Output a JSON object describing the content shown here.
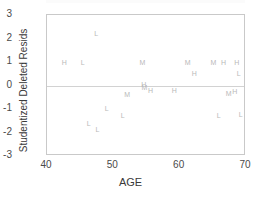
{
  "chart_data": {
    "type": "scatter",
    "title": "",
    "xlabel": "AGE",
    "ylabel": "Studentized Deleted Resids",
    "xlim": [
      40,
      70
    ],
    "ylim": [
      -3,
      3
    ],
    "xticks": [
      "40",
      "50",
      "60",
      "70"
    ],
    "yticks": [
      "3",
      "2",
      "1",
      "0",
      "-1",
      "-2",
      "-3"
    ],
    "xtick_values": [
      40,
      50,
      60,
      70
    ],
    "ytick_values": [
      3,
      2,
      1,
      0,
      -1,
      -2,
      -3
    ],
    "grid": false,
    "legend": "none",
    "marker_style": "letter-glyph",
    "marker_color": "#b9b9b9",
    "series": [
      {
        "name": "H",
        "label": "H",
        "points": [
          {
            "x": 42.6,
            "y": 1.0,
            "label": "H"
          },
          {
            "x": 54.6,
            "y": 0.05,
            "label": "H"
          },
          {
            "x": 55.6,
            "y": -0.2,
            "label": "H"
          },
          {
            "x": 59.2,
            "y": -0.2,
            "label": "H"
          },
          {
            "x": 62.2,
            "y": 0.55,
            "label": "H"
          },
          {
            "x": 66.6,
            "y": 1.0,
            "label": "H"
          },
          {
            "x": 68.6,
            "y": 1.0,
            "label": "H"
          },
          {
            "x": 68.3,
            "y": -0.25,
            "label": "H"
          }
        ]
      },
      {
        "name": "L",
        "label": "L",
        "points": [
          {
            "x": 45.4,
            "y": 1.0,
            "label": "L"
          },
          {
            "x": 47.4,
            "y": 2.25,
            "label": "L"
          },
          {
            "x": 46.3,
            "y": -1.6,
            "label": "L"
          },
          {
            "x": 47.6,
            "y": -1.85,
            "label": "L"
          },
          {
            "x": 49.0,
            "y": -0.95,
            "label": "L"
          },
          {
            "x": 51.4,
            "y": -1.25,
            "label": "L"
          },
          {
            "x": 65.9,
            "y": -1.25,
            "label": "L"
          },
          {
            "x": 68.9,
            "y": 0.55,
            "label": "L"
          },
          {
            "x": 69.2,
            "y": -1.2,
            "label": "L"
          }
        ]
      },
      {
        "name": "M",
        "label": "M",
        "points": [
          {
            "x": 52.1,
            "y": -0.35,
            "label": "M"
          },
          {
            "x": 54.4,
            "y": 1.0,
            "label": "M"
          },
          {
            "x": 54.7,
            "y": -0.05,
            "label": "M"
          },
          {
            "x": 61.2,
            "y": 1.0,
            "label": "M"
          },
          {
            "x": 65.1,
            "y": 1.0,
            "label": "M"
          },
          {
            "x": 67.4,
            "y": -0.3,
            "label": "M"
          }
        ]
      }
    ],
    "reference_lines": [
      {
        "axis": "y",
        "value": 0,
        "color": "#d2d2d2"
      }
    ]
  }
}
